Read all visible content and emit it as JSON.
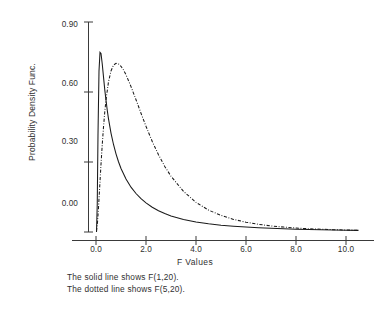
{
  "chart_data": {
    "type": "line",
    "title": "",
    "xlabel": "F Values",
    "ylabel": "Probability Density Func.",
    "xlim": [
      0.0,
      11.6
    ],
    "ylim": [
      0.0,
      0.96
    ],
    "grid": false,
    "legend_position": "below-axes-caption",
    "xticks": [
      "0.0",
      "2.0",
      "4.0",
      "6.0",
      "8.0",
      "10.0"
    ],
    "xtick_values": [
      0.0,
      2.0,
      4.0,
      6.0,
      8.0,
      10.0
    ],
    "yticks": [
      "0.00",
      "0.30",
      "0.60",
      "0.90"
    ],
    "ytick_values": [
      0.0,
      0.3,
      0.6,
      0.9
    ],
    "series": [
      {
        "name": "F(1,20)",
        "style": "solid",
        "color": "#1a1a1a",
        "x": [
          0.02,
          0.05,
          0.08,
          0.12,
          0.16,
          0.2,
          0.25,
          0.3,
          0.35,
          0.4,
          0.45,
          0.5,
          0.6,
          0.7,
          0.8,
          0.9,
          1.0,
          1.2,
          1.4,
          1.6,
          1.8,
          2.0,
          2.25,
          2.5,
          2.75,
          3.0,
          3.5,
          4.0,
          4.5,
          5.0,
          5.5,
          6.0,
          6.5,
          7.0,
          7.5,
          8.0,
          8.5,
          9.0,
          9.5,
          10.0,
          10.5
        ],
        "y": [
          0.0,
          0.12,
          0.42,
          0.69,
          0.77,
          0.765,
          0.72,
          0.665,
          0.61,
          0.565,
          0.522,
          0.485,
          0.424,
          0.375,
          0.335,
          0.301,
          0.272,
          0.227,
          0.192,
          0.165,
          0.143,
          0.125,
          0.106,
          0.091,
          0.079,
          0.069,
          0.054,
          0.043,
          0.035,
          0.029,
          0.025,
          0.021,
          0.018,
          0.016,
          0.014,
          0.012,
          0.011,
          0.0095,
          0.0085,
          0.0077,
          0.007
        ]
      },
      {
        "name": "F(5,20)",
        "style": "dotted",
        "color": "#1a1a1a",
        "x": [
          0.02,
          0.06,
          0.1,
          0.15,
          0.2,
          0.25,
          0.3,
          0.35,
          0.4,
          0.5,
          0.6,
          0.7,
          0.8,
          0.9,
          1.0,
          1.1,
          1.2,
          1.4,
          1.6,
          1.8,
          2.0,
          2.25,
          2.5,
          2.75,
          3.0,
          3.5,
          4.0,
          4.5,
          5.0,
          5.5,
          6.0,
          6.5,
          7.0,
          7.5,
          8.0,
          8.5,
          9.0,
          9.5,
          10.0,
          10.5
        ],
        "y": [
          0.004,
          0.041,
          0.104,
          0.198,
          0.29,
          0.375,
          0.45,
          0.513,
          0.566,
          0.644,
          0.69,
          0.715,
          0.723,
          0.72,
          0.71,
          0.694,
          0.674,
          0.623,
          0.567,
          0.509,
          0.453,
          0.388,
          0.331,
          0.281,
          0.239,
          0.174,
          0.127,
          0.094,
          0.071,
          0.054,
          0.042,
          0.033,
          0.026,
          0.021,
          0.017,
          0.014,
          0.012,
          0.01,
          0.0085,
          0.0073
        ]
      }
    ],
    "caption_lines": [
      "The solid line shows F(1,20).",
      "The dotted line shows F(5,20)."
    ]
  },
  "axes": {
    "ylabel": "Probability Density Func.",
    "xlabel": "F Values",
    "ytick_labels": [
      "0.90",
      "0.60",
      "0.30",
      "0.00"
    ],
    "xtick_labels": [
      "0.0",
      "2.0",
      "4.0",
      "6.0",
      "8.0",
      "10.0"
    ]
  },
  "caption": {
    "line1": "The solid line shows F(1,20).",
    "line2": "The dotted line shows F(5,20)."
  },
  "colors": {
    "ink": "#2b2b2b",
    "axis": "#3a3a3a",
    "background": "#ffffff"
  }
}
